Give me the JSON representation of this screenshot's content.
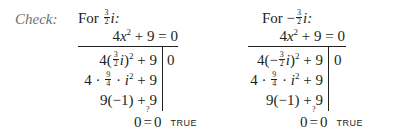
{
  "check_label": "Check:",
  "checks": [
    {
      "for_prefix": "For ",
      "sign": "",
      "frac_num": "3",
      "frac_den": "2",
      "var": "i",
      "colon": ":",
      "equation": {
        "lhs_coef": "4",
        "lhs_var": "x",
        "lhs_exp": "2",
        "rest": " + 9 = 0"
      },
      "rows": [
        {
          "pre": "4(",
          "sign": "",
          "frac_num": "3",
          "frac_den": "2",
          "var": "i",
          "post": ")",
          "exp": "2",
          "tail": " + 9"
        },
        {
          "pre": "4 · ",
          "frac_num": "9",
          "frac_den": "4",
          "mid": " · ",
          "var": "i",
          "exp": "2",
          "tail": " + 9"
        },
        {
          "text": "9(−1) + 9"
        }
      ],
      "rhs": "0",
      "final": {
        "left": "0",
        "question": "?",
        "eq": "=",
        "right": "0",
        "verdict": "TRUE"
      }
    },
    {
      "for_prefix": "For ",
      "sign": "−",
      "frac_num": "3",
      "frac_den": "2",
      "var": "i",
      "colon": ":",
      "equation": {
        "lhs_coef": "4",
        "lhs_var": "x",
        "lhs_exp": "2",
        "rest": " + 9 = 0"
      },
      "rows": [
        {
          "pre": "4(",
          "sign": "−",
          "frac_num": "3",
          "frac_den": "2",
          "var": "i",
          "post": ")",
          "exp": "2",
          "tail": " + 9"
        },
        {
          "pre": "4 · ",
          "frac_num": "9",
          "frac_den": "4",
          "mid": " · ",
          "var": "i",
          "exp": "2",
          "tail": " + 9"
        },
        {
          "text": "9(−1) + 9"
        }
      ],
      "rhs": "0",
      "final": {
        "left": "0",
        "question": "?",
        "eq": "=",
        "right": "0",
        "verdict": "TRUE"
      }
    }
  ]
}
